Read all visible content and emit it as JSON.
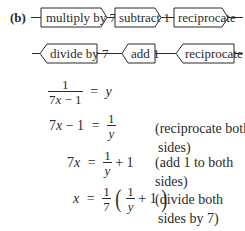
{
  "part_label": "(b)",
  "forward_chain": [
    {
      "label": "multiply by 7"
    },
    {
      "label": "subtract 1"
    },
    {
      "label": "reciprocate"
    }
  ],
  "inverse_chain": [
    {
      "label": "divide by 7"
    },
    {
      "label": "add 1"
    },
    {
      "label": "reciprocate"
    }
  ],
  "equations": [
    {
      "lhs_num": "1",
      "lhs_den_a": "7",
      "lhs_den_x": "x",
      "lhs_den_b": " − 1",
      "eq": "=",
      "rhs_var": "y",
      "comment_line1": "",
      "comment_line2": ""
    },
    {
      "lhs_a": "7",
      "lhs_x": "x",
      "lhs_b": " − 1",
      "eq": "=",
      "rhs_num": "1",
      "rhs_den": "y",
      "comment_line1": "(reciprocate both",
      "comment_line2": "sides)"
    },
    {
      "lhs_a": "7",
      "lhs_x": "x",
      "eq": "=",
      "rhs_num": "1",
      "rhs_den": "y",
      "rhs_tail": " + 1",
      "comment_line1": "(add 1 to both",
      "comment_line2": "sides)"
    },
    {
      "lhs_x": "x",
      "eq": "=",
      "coef_num": "1",
      "coef_den": "7",
      "paren_open": "(",
      "inner_num": "1",
      "inner_den": "y",
      "inner_tail": " + 1",
      "paren_close": ")",
      "comment_line1": "(divide both",
      "comment_line2": "sides by 7)"
    }
  ],
  "colors": {
    "ink": "#2b2b2b",
    "background": "#ffffff"
  }
}
